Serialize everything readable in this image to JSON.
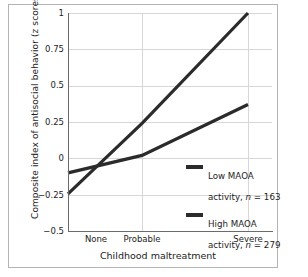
{
  "chart_data": {
    "type": "line",
    "title": "",
    "xlabel": "Childhood maltreatment",
    "ylabel": "Composite index of antisocial behavior (z scores)",
    "categories": [
      "None",
      "Probable",
      "Severe"
    ],
    "ylim": [
      -0.5,
      1
    ],
    "yticks": [
      "1",
      "0.75",
      "0.5",
      "0.25",
      "0",
      "−0.25",
      "−0.5"
    ],
    "ytick_values": [
      1,
      0.75,
      0.5,
      0.25,
      0,
      -0.25,
      -0.5
    ],
    "grid": "both",
    "legend_position": "inside-lower-right",
    "series": [
      {
        "name": "Low MAOA activity, n = 163",
        "label_line1": "Low MAOA",
        "label_line2_prefix": "activity, ",
        "label_line2_italic": "n",
        "label_line2_suffix": " = 163",
        "n": 163,
        "values": [
          -0.245,
          0.24,
          1.0
        ],
        "color": "#2b2b2b"
      },
      {
        "name": "High MAOA activity, n = 279",
        "label_line1": "High MAOA",
        "label_line2_prefix": "activity, ",
        "label_line2_italic": "n",
        "label_line2_suffix": " = 279",
        "n": 279,
        "values": [
          -0.1,
          0.02,
          0.37
        ],
        "color": "#2b2b2b"
      }
    ]
  },
  "axes": {
    "ylabel": "Composite index of antisocial behavior (z scores)",
    "xlabel": "Childhood maltreatment",
    "xticks": [
      "None",
      "Probable",
      "Severe"
    ],
    "yticks": [
      "1",
      "0.75",
      "0.5",
      "0.25",
      "0",
      "−0.25",
      "−0.5"
    ]
  },
  "legend": {
    "entries": [
      {
        "line1": "Low MAOA",
        "prefix": "activity, ",
        "italic": "n",
        "suffix": " = 163"
      },
      {
        "line1": "High MAOA",
        "prefix": "activity, ",
        "italic": "n",
        "suffix": " = 279"
      }
    ]
  },
  "colors": {
    "line": "#2b2b2b",
    "grid": "#d7d7d7",
    "axis": "#6b6b6b",
    "frame": "#b4b4b4",
    "text": "#1c1c1c",
    "background": "#ffffff"
  }
}
